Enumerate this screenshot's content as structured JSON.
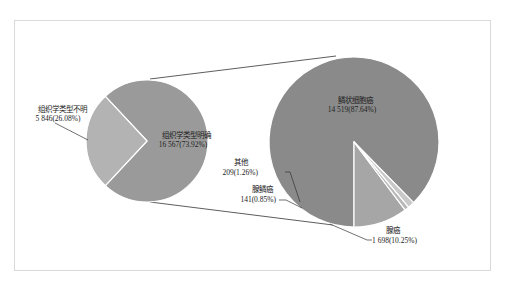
{
  "chart_data": {
    "type": "pie",
    "subtype": "pie-of-pie",
    "title": "",
    "colors": {
      "primary_known": "#9a9a9a",
      "primary_unknown": "#b3b3b3",
      "squamous": "#8a8a8a",
      "adeno": "#a6a6a6",
      "adenosquamous": "#b8b8b8",
      "other": "#c8c8c8",
      "separator": "#ffffff",
      "connector": "#333333"
    },
    "primary": {
      "slices": [
        {
          "label": "组织学类型明确",
          "value": 16567,
          "value_text": "16 567(73.92%)",
          "percent": 73.92
        },
        {
          "label": "组织学类型不明",
          "value": 5846,
          "value_text": "5 846(26.08%)",
          "percent": 26.08
        }
      ]
    },
    "secondary": {
      "parent": "组织学类型明确",
      "slices": [
        {
          "label": "鳞状细胞癌",
          "value": 14519,
          "value_text": "14 519(87.64%)",
          "percent": 87.64
        },
        {
          "label": "腺癌",
          "value": 1698,
          "value_text": "1 698(10.25%)",
          "percent": 10.25
        },
        {
          "label": "腺鳞癌",
          "value": 141,
          "value_text": "141(0.85%)",
          "percent": 0.85
        },
        {
          "label": "其他",
          "value": 209,
          "value_text": "209(1.26%)",
          "percent": 1.26
        }
      ]
    },
    "legend": "none",
    "grid": false
  }
}
